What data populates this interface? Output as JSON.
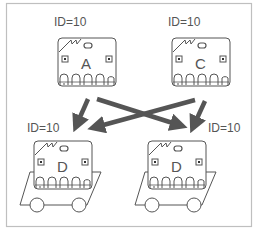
{
  "diagram": {
    "frame_color": "#bfbfbf",
    "stroke_color": "#555555",
    "arrow_color": "#555555",
    "nodes": [
      {
        "id": "A",
        "label": "ID=10",
        "letter": "A",
        "position": "top-left",
        "on_cart": false
      },
      {
        "id": "C",
        "label": "ID=10",
        "letter": "C",
        "position": "top-right",
        "on_cart": false
      },
      {
        "id": "B",
        "label": "ID=10",
        "letter": "B",
        "position": "bottom-left",
        "on_cart": true
      },
      {
        "id": "D",
        "label": "ID=10",
        "letter": "D",
        "position": "bottom-right",
        "on_cart": true
      }
    ],
    "edges": [
      {
        "from": "A",
        "to": "B"
      },
      {
        "from": "A",
        "to": "D"
      },
      {
        "from": "C",
        "to": "B"
      },
      {
        "from": "C",
        "to": "D"
      }
    ]
  }
}
